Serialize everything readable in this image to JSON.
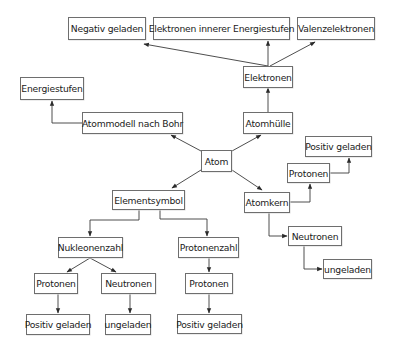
{
  "diagram": {
    "colors": {
      "line": "#3a3a3a",
      "border": "#6e6e6e",
      "text": "#1a1a1a",
      "background": "#ffffff"
    },
    "nodes": {
      "negativ_geladen": "Negativ geladen",
      "elektronen_innerer": "Elektronen innerer Energiestufen",
      "valenzelektronen": "Valenzelektronen",
      "elektronen": "Elektronen",
      "energiestufen": "Energiestufen",
      "atommodell_bohr": "Atommodell nach Bohr",
      "atomhuelle": "Atomhülle",
      "atom": "Atom",
      "positiv_geladen_kern": "Positiv geladen",
      "protonen_kern": "Protonen",
      "elementsymbol": "Elementsymbol",
      "atomkern": "Atomkern",
      "neutronen_kern": "Neutronen",
      "ungeladen_kern": "ungeladen",
      "nukleonenzahl": "Nukleonenzahl",
      "protonenzahl": "Protonenzahl",
      "protonen_nukleonen": "Protonen",
      "neutronen_nukleonen": "Neutronen",
      "protonen_protonenzahl": "Protonen",
      "positiv_geladen_nukleonen": "Positiv geladen",
      "ungeladen_nukleonen": "ungeladen",
      "positiv_geladen_protonenzahl": "Positiv geladen"
    },
    "edges": [
      {
        "from": "atom",
        "to": "atommodell_bohr"
      },
      {
        "from": "atom",
        "to": "atomhuelle"
      },
      {
        "from": "atom",
        "to": "elementsymbol"
      },
      {
        "from": "atom",
        "to": "atomkern"
      },
      {
        "from": "atommodell_bohr",
        "to": "energiestufen"
      },
      {
        "from": "atomhuelle",
        "to": "elektronen"
      },
      {
        "from": "elektronen",
        "to": "negativ_geladen"
      },
      {
        "from": "elektronen",
        "to": "elektronen_innerer"
      },
      {
        "from": "elektronen",
        "to": "valenzelektronen"
      },
      {
        "from": "atomkern",
        "to": "protonen_kern"
      },
      {
        "from": "protonen_kern",
        "to": "positiv_geladen_kern"
      },
      {
        "from": "atomkern",
        "to": "neutronen_kern"
      },
      {
        "from": "neutronen_kern",
        "to": "ungeladen_kern"
      },
      {
        "from": "elementsymbol",
        "to": "nukleonenzahl"
      },
      {
        "from": "elementsymbol",
        "to": "protonenzahl"
      },
      {
        "from": "nukleonenzahl",
        "to": "protonen_nukleonen"
      },
      {
        "from": "nukleonenzahl",
        "to": "neutronen_nukleonen"
      },
      {
        "from": "protonen_nukleonen",
        "to": "positiv_geladen_nukleonen"
      },
      {
        "from": "neutronen_nukleonen",
        "to": "ungeladen_nukleonen"
      },
      {
        "from": "protonenzahl",
        "to": "protonen_protonenzahl"
      },
      {
        "from": "protonen_protonenzahl",
        "to": "positiv_geladen_protonenzahl"
      }
    ]
  }
}
